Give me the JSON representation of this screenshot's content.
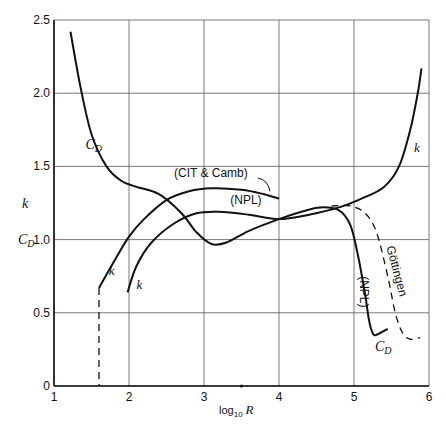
{
  "chart_data": {
    "type": "line",
    "title": "",
    "xlabel": "log10 R",
    "xlabel_parts": {
      "base": "log",
      "sub": "10",
      "var": "R"
    },
    "ylabel_lines": [
      "k",
      "C_D"
    ],
    "xlim": [
      1,
      6
    ],
    "ylim": [
      0,
      2.5
    ],
    "xticks": [
      1,
      2,
      3,
      4,
      5,
      6
    ],
    "xtick_labels": [
      "1",
      "2",
      "3",
      "4",
      "5",
      "6"
    ],
    "yticks": [
      0,
      0.5,
      1.0,
      1.5,
      2.0,
      2.5
    ],
    "ytick_labels": [
      "0",
      "0.5",
      "1.0",
      "1.5",
      "2.0",
      "2.5"
    ],
    "grid": true,
    "legend": "none (inline curve labels)",
    "series": [
      {
        "name": "C_D",
        "style": "solid",
        "points": [
          [
            1.22,
            2.42
          ],
          [
            1.35,
            2.05
          ],
          [
            1.5,
            1.72
          ],
          [
            1.7,
            1.5
          ],
          [
            1.9,
            1.4
          ],
          [
            2.1,
            1.36
          ],
          [
            2.4,
            1.31
          ],
          [
            2.7,
            1.18
          ],
          [
            2.9,
            1.05
          ],
          [
            3.1,
            0.97
          ],
          [
            3.3,
            0.98
          ],
          [
            3.6,
            1.06
          ],
          [
            4.0,
            1.14
          ],
          [
            4.3,
            1.19
          ],
          [
            4.55,
            1.22
          ],
          [
            4.8,
            1.2
          ],
          [
            4.95,
            1.1
          ],
          [
            5.05,
            0.9
          ],
          [
            5.15,
            0.62
          ],
          [
            5.2,
            0.45
          ],
          [
            5.25,
            0.36
          ],
          [
            5.3,
            0.35
          ],
          [
            5.45,
            0.39
          ]
        ]
      },
      {
        "name": "C_D (Göttingen)",
        "style": "dashed",
        "points": [
          [
            4.7,
            1.23
          ],
          [
            4.95,
            1.23
          ],
          [
            5.15,
            1.18
          ],
          [
            5.3,
            1.05
          ],
          [
            5.45,
            0.75
          ],
          [
            5.55,
            0.5
          ],
          [
            5.65,
            0.36
          ],
          [
            5.75,
            0.32
          ],
          [
            5.88,
            0.33
          ]
        ]
      },
      {
        "name": "k (CIT & Camb)",
        "style": "solid",
        "points": [
          [
            1.6,
            0.67
          ],
          [
            1.8,
            0.85
          ],
          [
            2.0,
            1.02
          ],
          [
            2.2,
            1.14
          ],
          [
            2.5,
            1.27
          ],
          [
            2.8,
            1.33
          ],
          [
            3.1,
            1.35
          ],
          [
            3.5,
            1.34
          ],
          [
            3.8,
            1.31
          ],
          [
            4.0,
            1.28
          ]
        ]
      },
      {
        "name": "k (NPL)",
        "style": "solid",
        "points": [
          [
            1.98,
            0.64
          ],
          [
            2.1,
            0.82
          ],
          [
            2.3,
            0.98
          ],
          [
            2.6,
            1.11
          ],
          [
            2.9,
            1.18
          ],
          [
            3.2,
            1.19
          ],
          [
            3.6,
            1.17
          ],
          [
            4.0,
            1.14
          ],
          [
            4.4,
            1.17
          ],
          [
            4.8,
            1.22
          ],
          [
            5.1,
            1.28
          ],
          [
            5.4,
            1.36
          ],
          [
            5.6,
            1.5
          ],
          [
            5.75,
            1.75
          ],
          [
            5.85,
            2.0
          ],
          [
            5.9,
            2.17
          ]
        ]
      },
      {
        "name": "k (NPL) low-R extension",
        "style": "dashed",
        "points": [
          [
            1.6,
            0.67
          ],
          [
            1.6,
            0.0
          ]
        ]
      }
    ],
    "annotations": [
      {
        "text": "C_D",
        "x": 1.42,
        "y": 1.62
      },
      {
        "text": "k",
        "x": 5.8,
        "y": 1.6
      },
      {
        "text": "(CIT & Camb)",
        "x": 2.6,
        "y": 1.43
      },
      {
        "text": "(NPL)",
        "x": 3.35,
        "y": 1.24
      },
      {
        "text": "k",
        "x": 1.73,
        "y": 0.76
      },
      {
        "text": "k",
        "x": 2.1,
        "y": 0.66
      },
      {
        "text": "(NPL)",
        "x": 5.08,
        "y": 0.75,
        "rotation": 90
      },
      {
        "text": "Göttingen",
        "x": 5.43,
        "y": 0.95,
        "rotation": 75
      },
      {
        "text": "C_D",
        "x": 5.28,
        "y": 0.24
      }
    ]
  }
}
